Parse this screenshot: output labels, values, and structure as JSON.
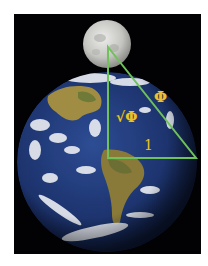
{
  "figure": {
    "labels": {
      "hypotenuse": "Φ",
      "vertical_leg": "√Φ",
      "base_leg": "1"
    },
    "colors": {
      "background": "#ffffff",
      "space": "#020204",
      "triangle_stroke": "#6fc25a",
      "label": "#e8c232",
      "ocean": "#1f3770",
      "land": "#9a8a3c",
      "cloud": "#e8ecf2",
      "moon": "#c9c9c6"
    },
    "triangle_vertices": [
      [
        108,
        47
      ],
      [
        108,
        158
      ],
      [
        196,
        158
      ]
    ]
  }
}
